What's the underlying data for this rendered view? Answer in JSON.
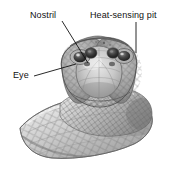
{
  "figure": {
    "background_color": "#ffffff",
    "ink_color": "#111111",
    "style": "grayscale pencil/halftone scientific illustration"
  },
  "labels": {
    "nostril": "Nostril",
    "heat_sensing_pit": "Heat-sensing pit",
    "eye": "Eye"
  },
  "leaders": {
    "nostril": {
      "from_x": 62,
      "from_y": 21,
      "to_x": 88,
      "to_y": 63
    },
    "heat_sensing_pit": {
      "from_x": 136,
      "from_y": 22,
      "to_x": 136,
      "to_y": 53
    },
    "eye": {
      "from_x": 34,
      "from_y": 76,
      "to_x": 76,
      "to_y": 64
    }
  },
  "anatomy": {
    "parts": [
      "head",
      "left-eye",
      "right-eye",
      "left-pit",
      "right-pit",
      "snout",
      "neck",
      "body-coil",
      "scales"
    ],
    "scale_pattern": "diamond",
    "view": "frontal"
  },
  "palette": {
    "paper": "#ffffff",
    "light_gray": "#dcdcdc",
    "mid_gray": "#a8a8a8",
    "dark_gray": "#6e6e6e",
    "shadow": "#3a3a3a",
    "outline": "#4a4a4a",
    "text": "#111111"
  }
}
